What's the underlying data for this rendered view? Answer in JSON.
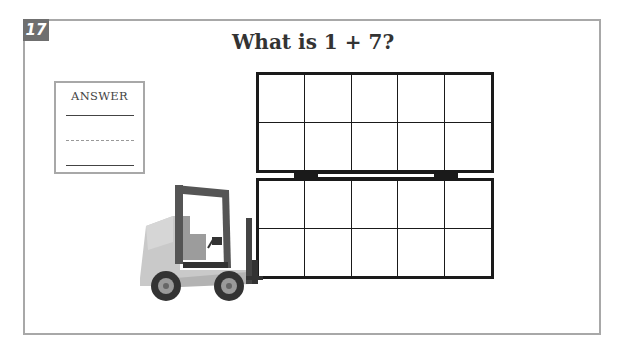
{
  "question": {
    "number": "17",
    "title": "What is 1 + 7?"
  },
  "answer_box": {
    "label": "ANSWER",
    "value": ""
  },
  "ten_frames": [
    {
      "rows": 2,
      "cols": 5,
      "filled": 0
    },
    {
      "rows": 2,
      "cols": 5,
      "filled": 0
    }
  ],
  "illustration": "forklift carrying two stacked ten-frames",
  "colors": {
    "frame_border": "#a8a8a8",
    "badge_bg": "#6f6f6f",
    "grid_line": "#1a1a1a"
  }
}
